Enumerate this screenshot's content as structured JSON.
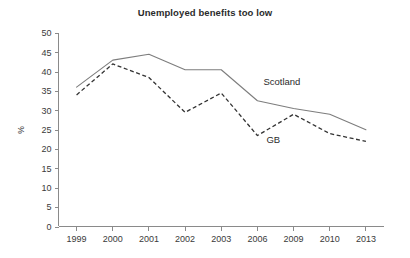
{
  "chart_data": {
    "type": "line",
    "title": "Unemployed benefits too low",
    "xlabel": "",
    "ylabel": "%",
    "categories": [
      "1999",
      "2000",
      "2001",
      "2002",
      "2003",
      "2006",
      "2009",
      "2010",
      "2013"
    ],
    "ylim": [
      0,
      50
    ],
    "yticks": [
      "0",
      "5",
      "10",
      "15",
      "20",
      "25",
      "30",
      "35",
      "40",
      "45",
      "50"
    ],
    "grid": false,
    "legend_position": "inline-annotation",
    "series": [
      {
        "name": "Scotland",
        "style": "solid",
        "color": "#7d7d7d",
        "values": [
          36,
          43,
          44.5,
          40.5,
          40.5,
          32.5,
          30.5,
          29,
          25
        ]
      },
      {
        "name": "GB",
        "style": "dashed",
        "color": "#333333",
        "values": [
          34,
          42,
          38.5,
          29.5,
          34.5,
          23.5,
          29,
          24,
          22
        ]
      }
    ],
    "annotations": [
      {
        "text": "Scotland",
        "series": "Scotland"
      },
      {
        "text": "GB",
        "series": "GB"
      }
    ]
  }
}
